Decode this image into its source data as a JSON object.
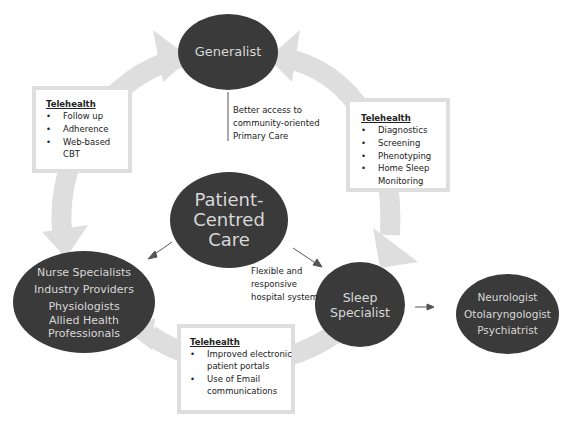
{
  "diagram": {
    "type": "patient-centred care model",
    "colors": {
      "node_fill": "#3a3a3a",
      "node_text": "#d8d8d8",
      "cycle_arrow": "#dedede",
      "box_border": "#dedede",
      "text": "#222222"
    },
    "nodes": {
      "generalist": {
        "label": "Generalist"
      },
      "center": {
        "lines": [
          "Patient-",
          "Centred",
          "Care"
        ]
      },
      "allied": {
        "lines": [
          "Nurse Specialists",
          "Industry Providers",
          "Physiologists",
          "Allied Health",
          "Professionals"
        ]
      },
      "sleep": {
        "lines": [
          "Sleep",
          "Specialist"
        ]
      },
      "specialists": {
        "lines": [
          "Neurologist",
          "Otolaryngologist",
          "Psychiatrist"
        ]
      }
    },
    "telehealth_boxes": {
      "left": {
        "title": "Telehealth",
        "items": [
          "Follow up",
          "Adherence",
          "Web-based CBT"
        ]
      },
      "right": {
        "title": "Telehealth",
        "items": [
          "Diagnostics",
          "Screening",
          "Phenotyping",
          "Home Sleep Monitoring"
        ]
      },
      "bottom": {
        "title": "Telehealth",
        "items": [
          "Improved electronic patient portals",
          "Use of Email communications"
        ]
      }
    },
    "notes": {
      "primary_care": [
        "Better access to",
        "community-oriented",
        "Primary Care"
      ],
      "hospital": [
        "Flexible and",
        "responsive",
        "hospital system"
      ]
    }
  }
}
